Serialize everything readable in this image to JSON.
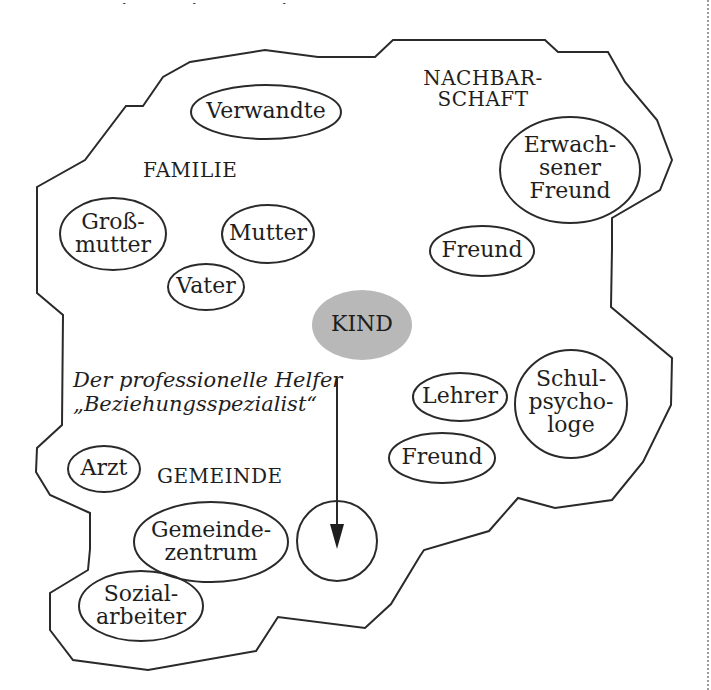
{
  "page_fragment": {
    "cut_off_top_text": "… , … , … ,"
  },
  "diagram": {
    "title": "",
    "center": {
      "label": "KIND",
      "fill": "#b8b8b8"
    },
    "regions": {
      "family": "FAMILIE",
      "neighborhood_line1": "NACHBAR-",
      "neighborhood_line2": "SCHAFT",
      "community": "GEMEINDE"
    },
    "nodes": {
      "verwandte": "Verwandte",
      "grossmutter_1": "Groß-",
      "grossmutter_2": "mutter",
      "mutter": "Mutter",
      "vater": "Vater",
      "erwachsener_1": "Erwach-",
      "erwachsener_2": "sener",
      "erwachsener_3": "Freund",
      "freund_neighborhood": "Freund",
      "lehrer": "Lehrer",
      "schulpsychologe_1": "Schul-",
      "schulpsychologe_2": "psycho-",
      "schulpsychologe_3": "loge",
      "freund_school": "Freund",
      "arzt": "Arzt",
      "gemeindezentrum_1": "Gemeinde-",
      "gemeindezentrum_2": "zentrum",
      "sozialarbeiter_1": "Sozial-",
      "sozialarbeiter_2": "arbeiter"
    },
    "helper": {
      "line1": "Der professionelle Helfer",
      "line2": "„Beziehungsspezialist“"
    },
    "colors": {
      "stroke": "#2a2a2a",
      "center_fill": "#b8b8b8",
      "background": "#ffffff"
    }
  }
}
